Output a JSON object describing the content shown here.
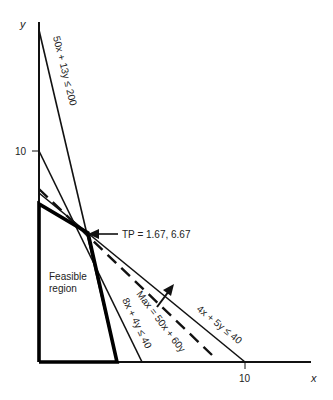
{
  "diagram": {
    "type": "linear-programming-graph",
    "axes": {
      "x_label": "x",
      "y_label": "y",
      "x_tick_label": "10",
      "y_tick_label": "10"
    },
    "constraints": [
      {
        "label": "50x + 13y ≤ 200"
      },
      {
        "label": "8x + 4y ≤ 40"
      },
      {
        "label": "4x + 5y ≤ 40"
      }
    ],
    "objective": {
      "label": "Max = 50x + 60y"
    },
    "tangent_point": {
      "label": "TP = 1.67, 6.67"
    },
    "feasible_region": {
      "line1": "Feasible",
      "line2": "region"
    }
  }
}
